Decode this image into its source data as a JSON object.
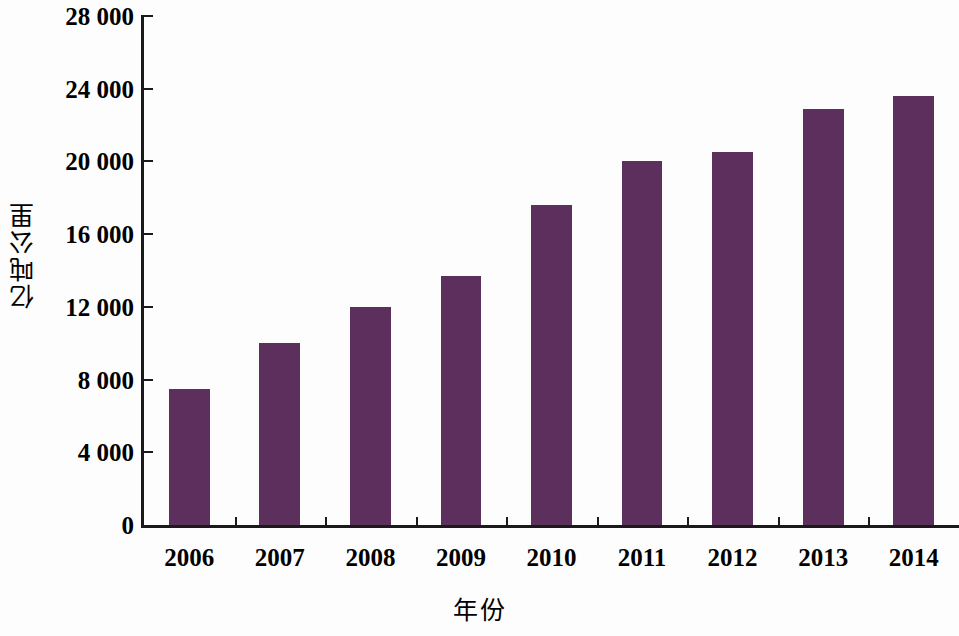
{
  "chart_data": {
    "type": "bar",
    "title": "",
    "xlabel": "年份",
    "ylabel": "亿吨公里",
    "categories": [
      "2006",
      "2007",
      "2008",
      "2009",
      "2010",
      "2011",
      "2012",
      "2013",
      "2014"
    ],
    "values": [
      7500,
      10000,
      12000,
      13700,
      17600,
      20000,
      20500,
      22900,
      23600
    ],
    "ylim": [
      0,
      28000
    ],
    "y_ticks": [
      0,
      4000,
      8000,
      12000,
      16000,
      20000,
      24000,
      28000
    ],
    "y_tick_labels": [
      "0",
      "4 000",
      "8 000",
      "12 000",
      "16 000",
      "20 000",
      "24 000",
      "28 000"
    ],
    "grid": false,
    "legend": false,
    "legend_position": "none",
    "bar_color": "#5c2f5c",
    "axis_color": "#1a1a1a",
    "background_color": "#fdfdfd"
  }
}
